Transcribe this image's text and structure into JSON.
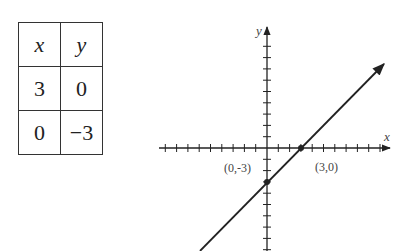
{
  "table": {
    "headers": [
      "x",
      "y"
    ],
    "rows": [
      [
        "3",
        "0"
      ],
      [
        "0",
        "−3"
      ]
    ]
  },
  "graph": {
    "x_axis_label": "x",
    "y_axis_label": "y",
    "point_labels": [
      "(0,-3)",
      "(3,0)"
    ]
  },
  "chart_data": {
    "type": "line",
    "title": "",
    "xlabel": "x",
    "ylabel": "y",
    "x_range": [
      -10,
      10
    ],
    "y_range": [
      -9,
      11
    ],
    "tick_spacing": 1,
    "series": [
      {
        "name": "y = x - 3",
        "x": [
          -3,
          3,
          0,
          11
        ],
        "y": [
          -6,
          0,
          -3,
          8
        ]
      }
    ],
    "points": [
      {
        "x": 0,
        "y": -3,
        "label": "(0,-3)"
      },
      {
        "x": 3,
        "y": 0,
        "label": "(3,0)"
      }
    ],
    "grid": false
  },
  "colors": {
    "ink": "#222222"
  }
}
